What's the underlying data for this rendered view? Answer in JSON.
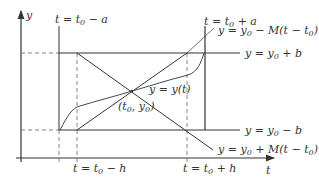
{
  "diagram": {
    "colors": {
      "stroke": "#333333",
      "dash": "#666666",
      "background": "#ffffff"
    },
    "axes": {
      "y_label": "y",
      "t_label": "t"
    },
    "labels": {
      "t_minus_a": {
        "pre": "t = t",
        "sub": "0",
        "post": " − a"
      },
      "t_plus_a": {
        "pre": "t = t",
        "sub": "0",
        "post": " + a"
      },
      "t_minus_h": {
        "pre": "t = t",
        "sub": "0",
        "post": " − h"
      },
      "t_plus_h": {
        "pre": "t = t",
        "sub": "0",
        "post": " + h"
      },
      "y_plus_b": {
        "pre": "y = y",
        "sub": "0",
        "post": " + b"
      },
      "y_minus_b": {
        "pre": "y = y",
        "sub": "0",
        "post": " − b"
      },
      "line_minus_M": {
        "pre": "y = y",
        "sub": "0",
        "mid": " − M(t − t",
        "sub2": "0",
        "post": ")"
      },
      "line_plus_M": {
        "pre": "y = y",
        "sub": "0",
        "mid": " + M(t − t",
        "sub2": "0",
        "post": ")"
      },
      "solution_curve": "y = y(t)",
      "center_point": {
        "pre": "(t",
        "sub": "0",
        "mid": ", y",
        "sub2": "0",
        "post": ")"
      }
    }
  }
}
